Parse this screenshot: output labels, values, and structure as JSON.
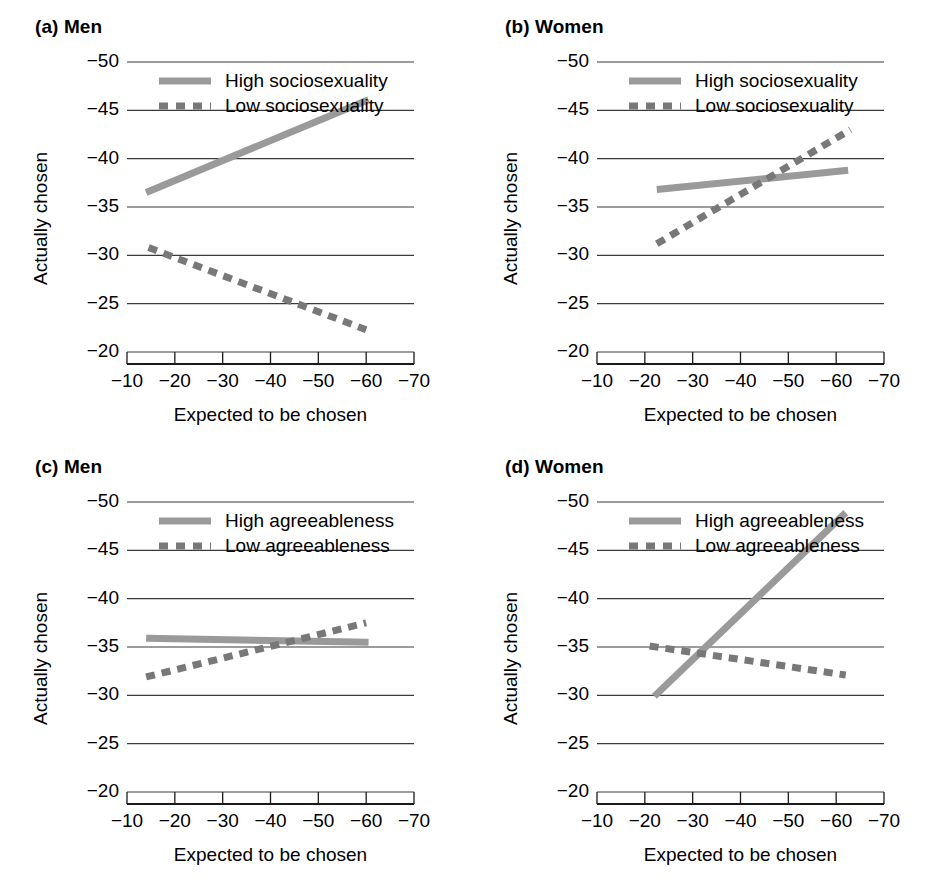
{
  "figure": {
    "background": "#ffffff",
    "text_color": "#000000",
    "solid_color": "#9a9a9a",
    "dashed_color": "#787878",
    "gridline_color": "#3a3a3a",
    "axis_color": "#1a1a1a"
  },
  "axes_common": {
    "ylabel": "Actually chosen",
    "xlabel": "Expected to be chosen",
    "yticks": [
      "−50",
      "−45",
      "−40",
      "−35",
      "−30",
      "−25",
      "−20"
    ],
    "ytick_values": [
      -50,
      -45,
      -40,
      -35,
      -30,
      -25,
      -20
    ],
    "xticks": [
      "−10",
      "−20",
      "−30",
      "−40",
      "−50",
      "−60",
      "−70"
    ],
    "xtick_values": [
      -10,
      -20,
      -30,
      -40,
      -50,
      -60,
      -70
    ],
    "ylim": [
      -20,
      -50
    ],
    "xlim": [
      -10,
      -70
    ],
    "grid": "horizontal"
  },
  "chart_data": [
    {
      "id": "panel-a",
      "type": "line",
      "panel_label": "(a)",
      "title": "Men",
      "full_title": "(a) Men",
      "xlabel": "Expected to be chosen",
      "ylabel": "Actually chosen",
      "xlim": [
        -10,
        -70
      ],
      "ylim": [
        -20,
        -50
      ],
      "grid": true,
      "legend_position": "top-left-inside",
      "series": [
        {
          "name": "High sociosexuality",
          "style": "solid",
          "color": "#9a9a9a",
          "x": [
            -14.0,
            -60.5
          ],
          "y": [
            -36.5,
            -46.1
          ]
        },
        {
          "name": "Low sociosexuality",
          "style": "dashed",
          "color": "#787878",
          "x": [
            -14.5,
            -60.0
          ],
          "y": [
            -30.8,
            -22.3
          ]
        }
      ]
    },
    {
      "id": "panel-b",
      "type": "line",
      "panel_label": "(b)",
      "title": "Women",
      "full_title": "(b) Women",
      "xlabel": "Expected to be chosen",
      "ylabel": "Actually chosen",
      "xlim": [
        -10,
        -70
      ],
      "ylim": [
        -20,
        -50
      ],
      "grid": true,
      "legend_position": "top-left-inside",
      "series": [
        {
          "name": "High sociosexuality",
          "style": "solid",
          "color": "#9a9a9a",
          "x": [
            -22.5,
            -62.5
          ],
          "y": [
            -36.8,
            -38.8
          ]
        },
        {
          "name": "Low sociosexuality",
          "style": "dashed",
          "color": "#787878",
          "x": [
            -22.5,
            -63.0
          ],
          "y": [
            -31.2,
            -43.0
          ]
        }
      ]
    },
    {
      "id": "panel-c",
      "type": "line",
      "panel_label": "(c)",
      "title": "Men",
      "full_title": "(c) Men",
      "xlabel": "Expected to be chosen",
      "ylabel": "Actually chosen",
      "xlim": [
        -10,
        -70
      ],
      "ylim": [
        -20,
        -50
      ],
      "grid": true,
      "legend_position": "top-left-inside",
      "series": [
        {
          "name": "High agreeableness",
          "style": "solid",
          "color": "#9a9a9a",
          "x": [
            -14.0,
            -60.5
          ],
          "y": [
            -35.9,
            -35.5
          ]
        },
        {
          "name": "Low agreeableness",
          "style": "dashed",
          "color": "#787878",
          "x": [
            -14.0,
            -60.0
          ],
          "y": [
            -31.9,
            -37.5
          ]
        }
      ]
    },
    {
      "id": "panel-d",
      "type": "line",
      "panel_label": "(d)",
      "title": "Women",
      "full_title": "(d) Women",
      "xlabel": "Expected to be chosen",
      "ylabel": "Actually chosen",
      "xlim": [
        -10,
        -70
      ],
      "ylim": [
        -20,
        -50
      ],
      "grid": true,
      "legend_position": "top-left-inside",
      "series": [
        {
          "name": "High agreeableness",
          "style": "solid",
          "color": "#9a9a9a",
          "x": [
            -22.0,
            -62.0
          ],
          "y": [
            -29.9,
            -48.9
          ]
        },
        {
          "name": "Low agreeableness",
          "style": "dashed",
          "color": "#787878",
          "x": [
            -21.0,
            -62.0
          ],
          "y": [
            -35.1,
            -32.1
          ]
        }
      ]
    }
  ]
}
